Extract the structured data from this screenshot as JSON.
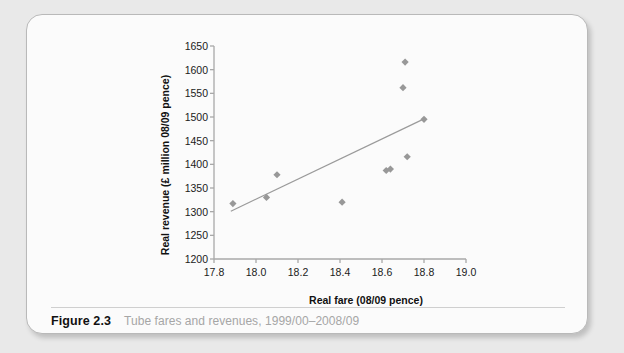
{
  "figure": {
    "number_label": "Figure 2.3",
    "caption": "Tube fares and revenues, 1999/00–2008/09"
  },
  "chart_data": {
    "type": "scatter",
    "title": "",
    "xlabel": "Real fare (08/09 pence)",
    "ylabel": "Real revenue (£ million 08/09 pence)",
    "xlim": [
      17.8,
      19.0
    ],
    "ylim": [
      1200,
      1650
    ],
    "xticks": [
      "17.8",
      "18.0",
      "18.2",
      "18.4",
      "18.6",
      "18.8",
      "19.0"
    ],
    "yticks": [
      "1200",
      "1250",
      "1300",
      "1350",
      "1400",
      "1450",
      "1500",
      "1550",
      "1600",
      "1650"
    ],
    "grid": false,
    "legend": "none",
    "marker_shape": "diamond",
    "marker_color": "#989898",
    "trendline_color": "#9a9a9a",
    "axis_color": "#a8a8a8",
    "points": [
      {
        "x": 17.89,
        "y": 1317
      },
      {
        "x": 18.05,
        "y": 1330
      },
      {
        "x": 18.1,
        "y": 1378
      },
      {
        "x": 18.41,
        "y": 1320
      },
      {
        "x": 18.62,
        "y": 1387
      },
      {
        "x": 18.64,
        "y": 1390
      },
      {
        "x": 18.72,
        "y": 1416
      },
      {
        "x": 18.7,
        "y": 1562
      },
      {
        "x": 18.71,
        "y": 1616
      },
      {
        "x": 18.8,
        "y": 1495
      }
    ],
    "trendline": {
      "x0": 17.88,
      "y0": 1301,
      "x1": 18.8,
      "y1": 1496
    }
  }
}
